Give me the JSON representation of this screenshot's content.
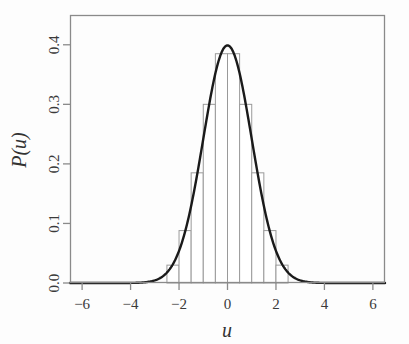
{
  "figure": {
    "background_color": "#fdfdfd",
    "frame_color": "#8a8a8a",
    "curve_color": "#1a1a1a",
    "bar_edge_color": "#9a9a9a",
    "bar_fill_color": "#ffffff",
    "tick_color": "#8a8a8a",
    "text_color": "#333333"
  },
  "chart_data": {
    "type": "bar",
    "title": "",
    "subtitle": "",
    "xlabel": "u",
    "ylabel": "P(u)",
    "xlim": [
      -6.5,
      6.5
    ],
    "ylim": [
      0.0,
      0.45
    ],
    "grid": false,
    "legend": null,
    "xticks": [
      -6,
      -4,
      -2,
      0,
      2,
      4,
      6
    ],
    "xtick_labels": [
      "−6",
      "−4",
      "−2",
      "0",
      "2",
      "4",
      "6"
    ],
    "yticks": [
      0.0,
      0.1,
      0.2,
      0.3,
      0.4
    ],
    "ytick_labels": [
      "0.0",
      "0.1",
      "0.2",
      "0.3",
      "0.4"
    ],
    "bin_width": 0.5,
    "bin_edges": [
      -2.5,
      -2.0,
      -1.5,
      -1.0,
      -0.5,
      0.0,
      0.5,
      1.0,
      1.5,
      2.0,
      2.5
    ],
    "bin_centers": [
      -2.25,
      -1.75,
      -1.25,
      -0.75,
      -0.25,
      0.25,
      0.75,
      1.25,
      1.75,
      2.25
    ],
    "values": [
      0.03,
      0.088,
      0.185,
      0.3,
      0.385,
      0.385,
      0.3,
      0.185,
      0.088,
      0.03
    ],
    "series": [
      {
        "name": "histogram",
        "type": "bar",
        "categories": [
          -2.25,
          -1.75,
          -1.25,
          -0.75,
          -0.25,
          0.25,
          0.75,
          1.25,
          1.75,
          2.25
        ],
        "values": [
          0.03,
          0.088,
          0.185,
          0.3,
          0.385,
          0.385,
          0.3,
          0.185,
          0.088,
          0.03
        ]
      },
      {
        "name": "normal-density",
        "type": "line",
        "mean": 0,
        "sigma": 1,
        "peak": 0.3989,
        "x_range": [
          -6.5,
          6.5
        ]
      }
    ]
  },
  "plot_geometry": {
    "frame_left": 70,
    "frame_right": 385,
    "frame_top": 15,
    "frame_bottom": 283
  }
}
